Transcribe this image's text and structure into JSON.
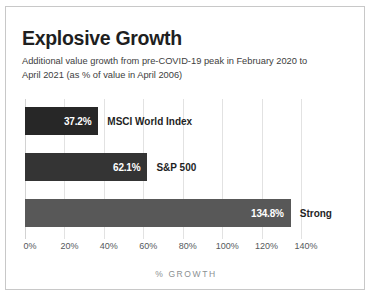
{
  "chart_data": {
    "type": "bar",
    "orientation": "horizontal",
    "title": "Explosive Growth",
    "subtitle": "Additional value growth from pre-COVID-19 peak in February 2020 to April 2021 (as % of value in April 2006)",
    "xlabel": "% GROWTH",
    "ylabel": "",
    "grid": true,
    "legend": "none",
    "xlim": [
      0,
      140
    ],
    "xticks": [
      0,
      20,
      40,
      60,
      80,
      100,
      120,
      140
    ],
    "xtick_labels": [
      "0%",
      "20%",
      "40%",
      "60%",
      "80%",
      "100%",
      "120%",
      "140%"
    ],
    "categories": [
      "MSCI World Index",
      "S&P 500",
      "Strong"
    ],
    "values": [
      37.2,
      62.1,
      134.8
    ],
    "value_labels": [
      "37.2%",
      "62.1%",
      "134.8%"
    ],
    "bar_colors": [
      "#272727",
      "#343434",
      "#585858"
    ],
    "bars": [
      {
        "category": "MSCI World Index",
        "value": 37.2,
        "value_label": "37.2%",
        "color": "#272727"
      },
      {
        "category": "S&P 500",
        "value": 62.1,
        "value_label": "62.1%",
        "color": "#343434"
      },
      {
        "category": "Strong",
        "value": 134.8,
        "value_label": "134.8%",
        "color": "#585858"
      }
    ]
  },
  "style": {
    "background": "#ffffff",
    "frame_border": "#c8c8c8",
    "gridline_color": "#e2e2e2",
    "title_color": "#1f1f1f",
    "subtitle_color": "#3d3d3d",
    "tick_color": "#55595c",
    "xlabel_color": "#8b8f92"
  }
}
